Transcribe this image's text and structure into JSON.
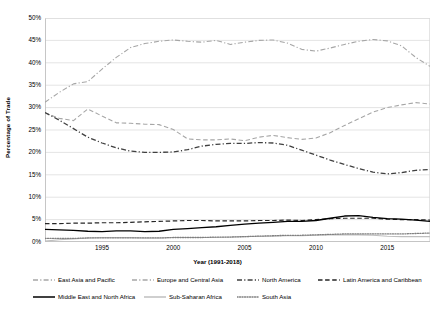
{
  "chart_data": {
    "type": "line",
    "title": "",
    "xlabel": "Year (1991-2018)",
    "ylabel": "Percentage of Trade",
    "xlim": [
      1991,
      2018
    ],
    "ylim": [
      0,
      0.5
    ],
    "grid": true,
    "legend_position": "bottom",
    "x_ticks": [
      1995,
      2000,
      2005,
      2010,
      2015
    ],
    "x_tick_labels": [
      "1995",
      "2000",
      "2005",
      "2010",
      "2015"
    ],
    "y_ticks": [
      0,
      0.05,
      0.1,
      0.15,
      0.2,
      0.25,
      0.3,
      0.35,
      0.4,
      0.45,
      0.5
    ],
    "y_tick_labels": [
      "0%",
      "5%",
      "10%",
      "15%",
      "20%",
      "25%",
      "30%",
      "35%",
      "40%",
      "45%",
      "50%"
    ],
    "x": [
      1991,
      1992,
      1993,
      1994,
      1995,
      1996,
      1997,
      1998,
      1999,
      2000,
      2001,
      2002,
      2003,
      2004,
      2005,
      2006,
      2007,
      2008,
      2009,
      2010,
      2011,
      2012,
      2013,
      2014,
      2015,
      2016,
      2017,
      2018
    ],
    "series": [
      {
        "name": "East Asia and Pacific",
        "color": "#A6A6A6",
        "style": "dash-dot",
        "width": 1.1,
        "values": [
          31.2,
          33.4,
          35.3,
          35.8,
          38.6,
          41.2,
          43.4,
          44.3,
          44.8,
          45.1,
          44.8,
          44.6,
          45.0,
          44.1,
          44.6,
          45.0,
          45.1,
          44.4,
          43.0,
          42.6,
          43.3,
          44.1,
          44.8,
          45.2,
          44.9,
          43.8,
          41.2,
          39.2
        ],
        "end_values_note": "declines after 2015 to about 38.5-39.5"
      },
      {
        "name": "Europe and Central Asia",
        "color": "#A6A6A6",
        "style": "dashed",
        "width": 1.1,
        "values": [
          28.8,
          27.6,
          27.1,
          29.7,
          28.1,
          26.6,
          26.5,
          26.3,
          26.2,
          25.1,
          23.0,
          22.8,
          22.8,
          23.0,
          22.6,
          23.4,
          23.8,
          23.3,
          22.9,
          23.2,
          24.4,
          26.0,
          27.5,
          29.0,
          30.0,
          30.6,
          31.1,
          30.8
        ]
      },
      {
        "name": "North America",
        "color": "#404040",
        "style": "dash-dot",
        "width": 1.3,
        "values": [
          28.9,
          27.2,
          25.3,
          23.4,
          22.1,
          21.0,
          20.3,
          20.0,
          20.0,
          20.1,
          20.6,
          21.4,
          21.8,
          22.0,
          22.0,
          22.2,
          22.1,
          21.6,
          20.5,
          19.4,
          18.3,
          17.3,
          16.4,
          15.6,
          15.2,
          15.5,
          16.0,
          16.2
        ]
      },
      {
        "name": "Latin America and Caribbean",
        "color": "#262626",
        "style": "dashed",
        "width": 1.2,
        "values": [
          4.1,
          4.1,
          4.2,
          4.2,
          4.3,
          4.3,
          4.4,
          4.5,
          4.6,
          4.7,
          4.8,
          4.8,
          4.7,
          4.7,
          4.7,
          4.8,
          4.8,
          4.9,
          4.8,
          5.0,
          5.2,
          5.3,
          5.3,
          5.3,
          5.1,
          5.0,
          5.0,
          4.9
        ]
      },
      {
        "name": "Middle East and North Africa",
        "color": "#000000",
        "style": "solid",
        "width": 1.3,
        "values": [
          2.8,
          2.7,
          2.6,
          2.4,
          2.3,
          2.5,
          2.5,
          2.3,
          2.4,
          2.8,
          3.0,
          3.2,
          3.4,
          3.7,
          4.0,
          4.2,
          4.4,
          4.6,
          4.6,
          4.8,
          5.3,
          5.8,
          5.9,
          5.5,
          5.2,
          5.1,
          4.9,
          4.6
        ]
      },
      {
        "name": "Sub-Saharan Africa",
        "color": "#BFBFBF",
        "style": "solid",
        "width": 1.1,
        "values": [
          0.2,
          0.5,
          0.7,
          0.9,
          1.0,
          1.0,
          1.0,
          0.9,
          0.9,
          1.0,
          1.0,
          1.0,
          1.0,
          1.1,
          1.2,
          1.3,
          1.3,
          1.4,
          1.4,
          1.5,
          1.6,
          1.6,
          1.6,
          1.5,
          1.3,
          1.2,
          1.2,
          1.2
        ]
      },
      {
        "name": "South Asia",
        "color": "#808080",
        "style": "dotted",
        "width": 1.3,
        "values": [
          0.8,
          0.8,
          0.8,
          0.9,
          0.9,
          0.9,
          0.9,
          0.9,
          0.9,
          1.0,
          1.0,
          1.0,
          1.1,
          1.1,
          1.2,
          1.3,
          1.4,
          1.5,
          1.5,
          1.6,
          1.7,
          1.8,
          1.8,
          1.8,
          1.8,
          1.8,
          1.9,
          2.0
        ]
      }
    ]
  },
  "legend": {
    "rows": [
      [
        {
          "label": "East Asia and Pacific",
          "color": "#A6A6A6",
          "style": "dash-dot",
          "left": 33
        },
        {
          "label": "Europe and Central Asia",
          "color": "#A6A6A6",
          "style": "dash-dot",
          "left": 132
        },
        {
          "label": "North America",
          "color": "#404040",
          "style": "dash-dot",
          "left": 237
        },
        {
          "label": "Latin America and Caribbean",
          "color": "#262626",
          "style": "dashed",
          "left": 318
        }
      ],
      [
        {
          "label": "Middle East and North Africa",
          "color": "#000000",
          "style": "solid",
          "left": 33
        },
        {
          "label": "Sub-Saharan Africa",
          "color": "#BFBFBF",
          "style": "solid",
          "left": 144
        },
        {
          "label": "South Asia",
          "color": "#808080",
          "style": "dotted",
          "left": 237
        }
      ]
    ]
  },
  "axes": {
    "x_title": "Year (1991-2018)",
    "y_title": "Percentage of Trade"
  },
  "colors": {
    "grid": "#D9D9D9",
    "axis": "#BFBFBF",
    "background": "#FFFFFF",
    "text": "#000000"
  }
}
